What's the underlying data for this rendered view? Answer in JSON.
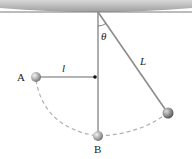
{
  "diagram": {
    "type": "pendulum",
    "labels": {
      "point_a": "A",
      "point_b": "B",
      "short_length": "l",
      "pendulum_length": "L",
      "angle": "θ"
    },
    "colors": {
      "ceiling": "#a9a9a9",
      "string": "#8c8c8c",
      "arc": "#b0b0b0",
      "bob": "#9a9a9a"
    }
  }
}
